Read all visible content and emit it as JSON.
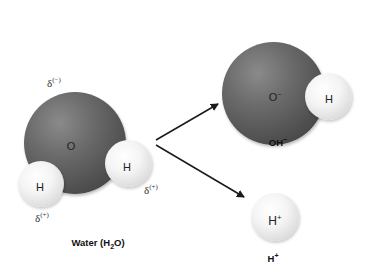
{
  "water": {
    "oxygen_label": "O",
    "hydrogen_left_label": "H",
    "hydrogen_right_label": "H",
    "delta_oxygen": "δ",
    "delta_oxygen_sup": "(−)",
    "delta_h_left": "δ",
    "delta_h_left_sup": "(+)",
    "delta_h_right": "δ",
    "delta_h_right_sup": "(+)",
    "caption_pre": "Water (H",
    "caption_sub": "2",
    "caption_post": "O)"
  },
  "hydroxide": {
    "oxygen_label": "O",
    "oxygen_sup": "−",
    "hydrogen_label": "H",
    "caption": "OH",
    "caption_sup": "−"
  },
  "proton": {
    "label": "H",
    "label_sup": "+",
    "caption": "H",
    "caption_sup": "+"
  },
  "colors": {
    "oxygen": "#5a5a5a",
    "hydrogen": "#eeeeee",
    "arrow": "#1a1a1a"
  }
}
